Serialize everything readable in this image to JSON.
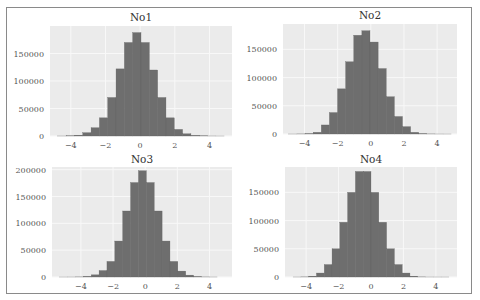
{
  "colors": {
    "plot_background": "#ebebeb",
    "grid": "#f8f8f8",
    "bar_fill": "#6e6e6e",
    "bar_edge": "#5e5e5e",
    "frame": "#8a8a8a"
  },
  "chart_data": [
    {
      "type": "bar",
      "subtype": "histogram",
      "title": "No1",
      "xlabel": "",
      "ylabel": "",
      "grid": true,
      "xlim": [
        -5.2,
        5.3
      ],
      "ylim": [
        0,
        200000
      ],
      "xticks": [
        -4,
        -2,
        0,
        2,
        4
      ],
      "xtick_labels": [
        "−4",
        "−2",
        "0",
        "2",
        "4"
      ],
      "yticks": [
        0,
        50000,
        100000,
        150000
      ],
      "ytick_labels": [
        "0",
        "50000",
        "100000",
        "150000"
      ],
      "bin_edges": [
        -4.75,
        -4.27,
        -3.79,
        -3.31,
        -2.83,
        -2.35,
        -1.87,
        -1.39,
        -0.91,
        -0.43,
        0.05,
        0.53,
        1.01,
        1.49,
        1.97,
        2.45,
        2.93,
        3.41,
        3.89,
        4.37,
        4.85
      ],
      "values": [
        50,
        300,
        1500,
        6000,
        15000,
        33000,
        70000,
        122000,
        170000,
        188000,
        170000,
        120000,
        70000,
        33000,
        12000,
        4000,
        1200,
        300,
        60,
        10
      ]
    },
    {
      "type": "bar",
      "subtype": "histogram",
      "title": "No2",
      "xlabel": "",
      "ylabel": "",
      "grid": true,
      "xlim": [
        -5.3,
        5.2
      ],
      "ylim": [
        0,
        195000
      ],
      "xticks": [
        -4,
        -2,
        0,
        2,
        4
      ],
      "xtick_labels": [
        "−4",
        "−2",
        "0",
        "2",
        "4"
      ],
      "yticks": [
        0,
        50000,
        100000,
        150000
      ],
      "ytick_labels": [
        "0",
        "50000",
        "100000",
        "150000"
      ],
      "bin_edges": [
        -4.95,
        -4.46,
        -3.97,
        -3.48,
        -2.99,
        -2.5,
        -2.01,
        -1.52,
        -1.03,
        -0.54,
        -0.05,
        0.44,
        0.93,
        1.42,
        1.91,
        2.4,
        2.89,
        3.38,
        3.87,
        4.36,
        4.85
      ],
      "values": [
        20,
        150,
        700,
        3000,
        16000,
        38000,
        80000,
        128000,
        175000,
        183000,
        163000,
        116000,
        66000,
        31000,
        13000,
        3000,
        700,
        150,
        30,
        5
      ]
    },
    {
      "type": "bar",
      "subtype": "histogram",
      "title": "No3",
      "xlabel": "",
      "ylabel": "",
      "grid": true,
      "xlim": [
        -5.8,
        5.4
      ],
      "ylim": [
        0,
        205000
      ],
      "xticks": [
        -4,
        -2,
        0,
        2,
        4
      ],
      "xtick_labels": [
        "−4",
        "−2",
        "0",
        "2",
        "4"
      ],
      "yticks": [
        0,
        50000,
        100000,
        150000,
        200000
      ],
      "ytick_labels": [
        "0",
        "50000",
        "100000",
        "150000",
        "200000"
      ],
      "bin_edges": [
        -5.32,
        -4.83,
        -4.34,
        -3.85,
        -3.36,
        -2.87,
        -2.38,
        -1.89,
        -1.4,
        -0.91,
        -0.42,
        0.07,
        0.56,
        1.05,
        1.54,
        2.03,
        2.52,
        3.01,
        3.5,
        3.99,
        4.48
      ],
      "values": [
        5,
        30,
        200,
        1200,
        4000,
        12000,
        29000,
        67000,
        123000,
        176000,
        198000,
        176000,
        123000,
        67000,
        29000,
        11000,
        3500,
        900,
        150,
        20
      ]
    },
    {
      "type": "bar",
      "subtype": "histogram",
      "title": "No4",
      "xlabel": "",
      "ylabel": "",
      "grid": true,
      "xlim": [
        -5.3,
        5.3
      ],
      "ylim": [
        0,
        195000
      ],
      "xticks": [
        -4,
        -2,
        0,
        2,
        4
      ],
      "xtick_labels": [
        "−4",
        "−2",
        "0",
        "2",
        "4"
      ],
      "yticks": [
        0,
        50000,
        100000,
        150000
      ],
      "ytick_labels": [
        "0",
        "50000",
        "100000",
        "150000"
      ],
      "bin_edges": [
        -4.8,
        -4.32,
        -3.84,
        -3.36,
        -2.88,
        -2.4,
        -1.92,
        -1.44,
        -0.96,
        -0.48,
        0.0,
        0.48,
        0.96,
        1.44,
        1.92,
        2.4,
        2.88,
        3.36,
        3.84,
        4.32,
        4.8
      ],
      "values": [
        20,
        200,
        1500,
        7000,
        22000,
        50000,
        97000,
        150000,
        187000,
        187000,
        150000,
        97000,
        50000,
        22000,
        7000,
        1500,
        200,
        20,
        5,
        1
      ]
    }
  ]
}
